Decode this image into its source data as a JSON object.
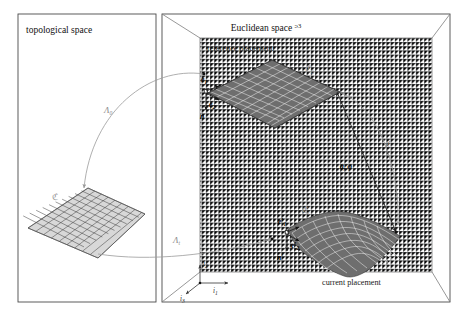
{
  "figure": {
    "caption_absent": true,
    "panels": {
      "left": {
        "title": "topological space",
        "body_label": "ℭ"
      },
      "right": {
        "title_main": "Euclidean space ",
        "title_symbol": "ᵓ",
        "title_exponent": "3",
        "reference_label": "reference placement",
        "current_label": "current placement",
        "reference_surface_label": "ℭ",
        "reference_surface_sub": "0",
        "current_surface_label": "ℭ",
        "current_surface_sub": "t"
      }
    },
    "maps": {
      "reference_map": "Λ",
      "reference_map_sub": "0",
      "current_map": "Λ",
      "current_map_sub": "t",
      "deformation_map": "χ",
      "motion_label_a": "a",
      "motion_label_comma": ", ",
      "motion_label_phi": "φ"
    },
    "reference_frame": {
      "e1": "e",
      "e1_sub": "1",
      "e2": "e",
      "e2_sub": "2",
      "normal": "n"
    },
    "current_frame": {
      "e1": "e′",
      "e1_sub": "1",
      "e2": "e′",
      "e2_sub": "2",
      "normal": "n′"
    },
    "axes": {
      "i1": "i",
      "i1_sub": "1",
      "i2": "i",
      "i2_sub": "2",
      "i3": "i",
      "i3_sub": "3"
    },
    "colors": {
      "frame_stroke": "#4a4a4a",
      "box_stroke": "#7d7d7d",
      "grid": "#c9cfd6",
      "arc": "#9b9b9b",
      "arrow": "#222222",
      "surface_dark": "#6a6a6a",
      "surface_light": "#cfcfcf",
      "text": "#111111"
    }
  }
}
